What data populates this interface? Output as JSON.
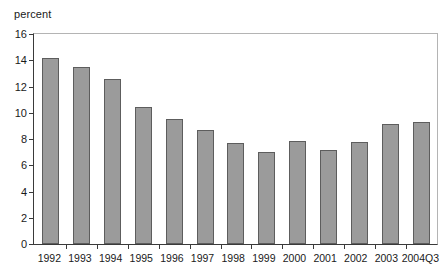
{
  "chart_data": {
    "type": "bar",
    "title": "",
    "xlabel": "",
    "ylabel": "percent",
    "ylim": [
      0,
      16
    ],
    "ytick_step": 2,
    "yticks": [
      16,
      14,
      12,
      10,
      8,
      6,
      4,
      2,
      0
    ],
    "grid": false,
    "legend": "none",
    "bar_color": "#9b9b9b",
    "bar_border_color": "#5d5d5d",
    "axis_color": "#3a3a3a",
    "frame_color": "#b4b4b4",
    "categories": [
      "1992",
      "1993",
      "1994",
      "1995",
      "1996",
      "1997",
      "1998",
      "1999",
      "2000",
      "2001",
      "2002",
      "2003",
      "2004Q3"
    ],
    "values": [
      14.2,
      13.5,
      12.55,
      10.45,
      9.55,
      8.7,
      7.7,
      7.0,
      7.85,
      7.15,
      7.75,
      9.15,
      9.3
    ]
  }
}
